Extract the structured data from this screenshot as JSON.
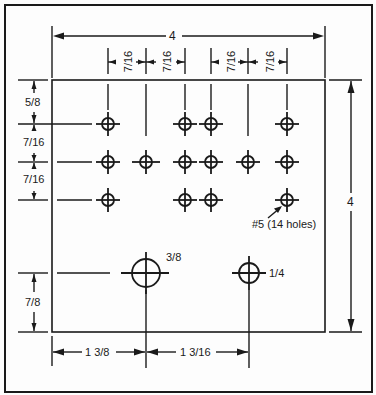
{
  "drawing": {
    "title": "Drilling template for 4 x 4 panel",
    "colors": {
      "ink": "#1a1a1a",
      "paper": "#fdfdfd"
    },
    "board": {
      "width": "4",
      "height": "4"
    },
    "dimensions": {
      "overall_width": "4",
      "overall_height": "4",
      "hole_spacing_top": [
        "7/16",
        "7/16",
        "7/16",
        "7/16"
      ],
      "left_top_offset": "5/8",
      "left_row_spacing": [
        "7/16",
        "7/16"
      ],
      "bottom_row_offset": "7/8",
      "bottom_left": "1 3/8",
      "bottom_right": "1 3/16"
    },
    "holes": {
      "small_hole_note": "#5 (14 holes)",
      "large_hole_label": "3/8",
      "medium_hole_label": "1/4",
      "small_hole_count": 14,
      "rows": [
        {
          "row": 1,
          "columns": [
            1,
            3,
            4,
            6
          ]
        },
        {
          "row": 2,
          "columns": [
            1,
            2,
            3,
            4,
            5,
            6
          ]
        },
        {
          "row": 3,
          "columns": [
            1,
            3,
            4,
            6
          ]
        }
      ]
    }
  }
}
